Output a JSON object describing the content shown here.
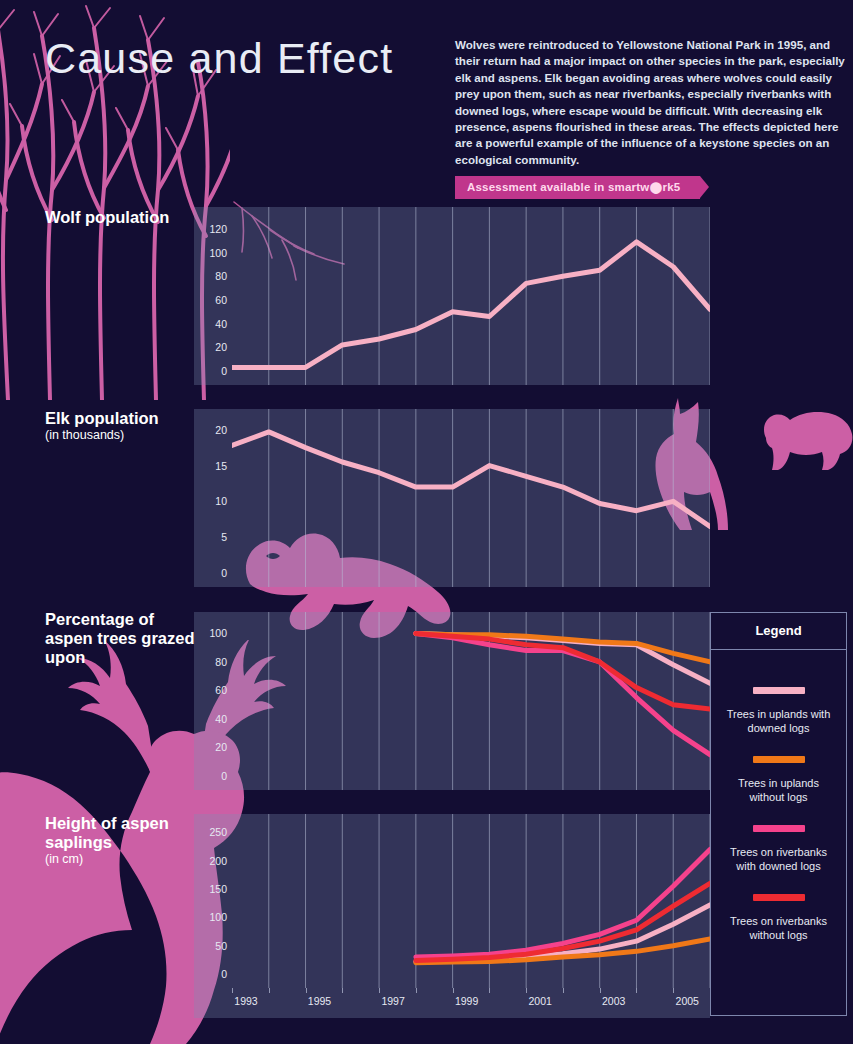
{
  "header": {
    "title": "Cause and Effect",
    "intro": "Wolves were reintroduced to Yellowstone National Park in 1995, and their return had a major impact on other species in the park, especially elk and aspens. Elk began avoiding areas where wolves could easily prey upon them, such as near riverbanks, especially riverbanks with downed logs, where escape would be difficult. With decreasing elk presence, aspens flourished in these areas. The effects depicted here are a powerful example of the influence of a keystone species on an ecological community.",
    "badge": "Assessment available in smartw⬤rk5"
  },
  "colors": {
    "page_background": "#130d33",
    "plot_background": "#3d3f6d",
    "axis_background": "#4a5078",
    "accent_pink": "#c0368c",
    "silhouette_pink": "#cc5fa5",
    "line_light_pink": "#f7b0c4",
    "line_orange": "#f07818",
    "line_magenta": "#f5428c",
    "line_red": "#ee2b32",
    "gridline": "#b9c0d8",
    "title_text": "#e9ecf5"
  },
  "xaxis": {
    "ticks": [
      1993,
      1994,
      1995,
      1996,
      1997,
      1998,
      1999,
      2000,
      2001,
      2002,
      2003,
      2004,
      2005,
      2006
    ],
    "labels": [
      "1993",
      "1995",
      "1997",
      "1999",
      "2001",
      "2003",
      "2005"
    ],
    "labeled_years": [
      1993,
      1995,
      1997,
      1999,
      2001,
      2003,
      2005
    ],
    "min": 1993,
    "max": 2006
  },
  "legend": {
    "title": "Legend",
    "items": [
      {
        "label": "Trees in uplands with downed logs",
        "color": "#f7b0c4"
      },
      {
        "label": "Trees in uplands without logs",
        "color": "#f07818"
      },
      {
        "label": "Trees on riverbanks with downed logs",
        "color": "#f5428c"
      },
      {
        "label": "Trees on riverbanks without logs",
        "color": "#ee2b32"
      }
    ]
  },
  "chart_data": [
    {
      "type": "line",
      "title": "Wolf population",
      "subtitle": "",
      "xlabel": "",
      "ylabel": "",
      "ylim": [
        0,
        130
      ],
      "yticks": [
        0,
        20,
        40,
        60,
        80,
        100,
        120
      ],
      "ticklabels": [
        "0",
        "20",
        "40",
        "60",
        "80",
        "100",
        "120"
      ],
      "grid": true,
      "x": [
        1993,
        1994,
        1995,
        1996,
        1997,
        1998,
        1999,
        2000,
        2001,
        2002,
        2003,
        2004,
        2005,
        2006
      ],
      "series": [
        {
          "name": "Wolf population",
          "color": "#f7b0c4",
          "values": [
            3,
            3,
            3,
            22,
            27,
            35,
            50,
            46,
            74,
            80,
            85,
            109,
            88,
            52
          ]
        }
      ]
    },
    {
      "type": "line",
      "title": "Elk population",
      "subtitle": "(in thousands)",
      "xlabel": "",
      "ylabel": "",
      "ylim": [
        0,
        21.5
      ],
      "yticks": [
        0,
        5,
        10,
        15,
        20
      ],
      "ticklabels": [
        "0",
        "5",
        "10",
        "15",
        "20"
      ],
      "grid": true,
      "x": [
        1993,
        1994,
        1995,
        1996,
        1997,
        1998,
        1999,
        2000,
        2001,
        2002,
        2003,
        2004,
        2005,
        2006
      ],
      "series": [
        {
          "name": "Elk population (thousands)",
          "color": "#f7b0c4",
          "values": [
            17.8,
            19.7,
            17.5,
            15.5,
            14.0,
            12.0,
            12.0,
            15.0,
            13.5,
            12.0,
            9.7,
            8.7,
            10.0,
            6.5
          ]
        }
      ]
    },
    {
      "type": "line",
      "title": "Percentage of aspen trees grazed upon",
      "subtitle": "",
      "xlabel": "",
      "ylabel": "",
      "ylim": [
        0,
        108
      ],
      "yticks": [
        0,
        20,
        40,
        60,
        80,
        100
      ],
      "ticklabels": [
        "0",
        "20",
        "40",
        "60",
        "80",
        "100"
      ],
      "grid": true,
      "x": [
        1998,
        1999,
        2000,
        2001,
        2002,
        2003,
        2004,
        2005,
        2006
      ],
      "series": [
        {
          "name": "Trees in uplands with downed logs",
          "color": "#f7b0c4",
          "values": [
            100,
            99,
            98,
            97,
            95,
            93,
            92,
            78,
            65
          ]
        },
        {
          "name": "Trees in uplands without logs",
          "color": "#f07818",
          "values": [
            100,
            99,
            99,
            98,
            96,
            94,
            93,
            86,
            80
          ]
        },
        {
          "name": "Trees on riverbanks with downed logs",
          "color": "#f5428c",
          "values": [
            100,
            97,
            92,
            88,
            88,
            80,
            55,
            32,
            15
          ]
        },
        {
          "name": "Trees on riverbanks without logs",
          "color": "#ee2b32",
          "values": [
            100,
            98,
            96,
            92,
            90,
            80,
            62,
            50,
            47
          ]
        }
      ]
    },
    {
      "type": "line",
      "title": "Height of aspen saplings",
      "subtitle": "(in cm)",
      "xlabel": "",
      "ylabel": "",
      "ylim": [
        0,
        265
      ],
      "yticks": [
        0,
        50,
        100,
        150,
        200,
        250
      ],
      "ticklabels": [
        "0",
        "50",
        "100",
        "150",
        "200",
        "250"
      ],
      "grid": true,
      "x": [
        1998,
        1999,
        2000,
        2001,
        2002,
        2003,
        2004,
        2005,
        2006
      ],
      "series": [
        {
          "name": "Trees in uplands with downed logs",
          "color": "#f7b0c4",
          "values": [
            22,
            24,
            26,
            30,
            36,
            44,
            58,
            88,
            122
          ]
        },
        {
          "name": "Trees in uplands without logs",
          "color": "#f07818",
          "values": [
            20,
            21,
            22,
            25,
            30,
            34,
            40,
            50,
            62
          ]
        },
        {
          "name": "Trees on riverbanks with downed logs",
          "color": "#f5428c",
          "values": [
            30,
            32,
            35,
            42,
            54,
            70,
            95,
            155,
            220
          ]
        },
        {
          "name": "Trees on riverbanks without logs",
          "color": "#ee2b32",
          "values": [
            24,
            26,
            29,
            35,
            45,
            58,
            78,
            120,
            160
          ]
        }
      ]
    }
  ],
  "chart_labels": [
    {
      "title": "Wolf population",
      "subtitle": ""
    },
    {
      "title": "Elk population",
      "subtitle": "(in thousands)"
    },
    {
      "title": "Percentage of aspen trees grazed upon",
      "subtitle": ""
    },
    {
      "title": "Height of aspen saplings",
      "subtitle": "(in cm)"
    }
  ]
}
